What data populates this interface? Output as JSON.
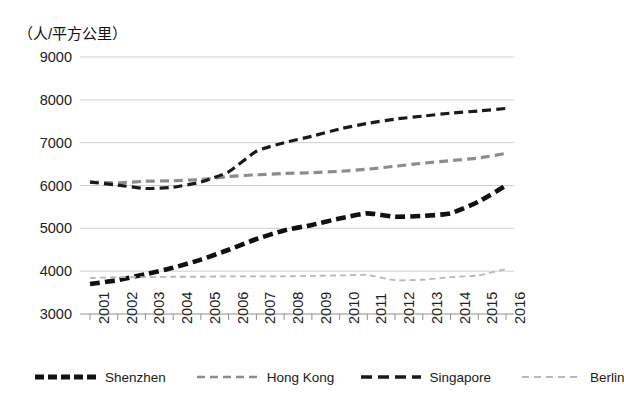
{
  "chart_data": {
    "type": "line",
    "title": "",
    "subtitle": "",
    "ylabel": "（人/平方公里）",
    "xlabel": "",
    "ylim": [
      3000,
      9000
    ],
    "ytick_values": [
      9000,
      8000,
      7000,
      6000,
      5000,
      4000,
      3000
    ],
    "ytick_labels": [
      "9000",
      "8000",
      "7000",
      "6000",
      "5000",
      "4000",
      "3000"
    ],
    "grid": true,
    "grid_axis": "y",
    "legend_position": "bottom",
    "categories": [
      "2001",
      "2002",
      "2003",
      "2004",
      "2005",
      "2006",
      "2007",
      "2008",
      "2009",
      "2010",
      "2011",
      "2012",
      "2013",
      "2014",
      "2015",
      "2016"
    ],
    "x": [
      2001,
      2002,
      2003,
      2004,
      2005,
      2006,
      2007,
      2008,
      2009,
      2010,
      2011,
      2012,
      2013,
      2014,
      2015,
      2016
    ],
    "series": [
      {
        "name": "Shenzhen",
        "color": "#111111",
        "style": "thick-dashed",
        "values": [
          3700,
          3790,
          3930,
          4080,
          4270,
          4500,
          4750,
          4950,
          5080,
          5230,
          5350,
          5270,
          5290,
          5350,
          5620,
          6000
        ]
      },
      {
        "name": "Hong Kong",
        "color": "#8c8c8c",
        "style": "dashed",
        "values": [
          6080,
          6060,
          6100,
          6110,
          6140,
          6210,
          6250,
          6280,
          6300,
          6330,
          6380,
          6450,
          6520,
          6580,
          6640,
          6750
        ]
      },
      {
        "name": "Singapore",
        "color": "#1a1a1a",
        "style": "dashed",
        "values": [
          6080,
          6010,
          5930,
          5960,
          6080,
          6320,
          6800,
          7000,
          7150,
          7320,
          7450,
          7550,
          7620,
          7690,
          7740,
          7800
        ]
      },
      {
        "name": "Berlin",
        "color": "#b8b8b8",
        "style": "fine-dashed",
        "values": [
          3840,
          3860,
          3860,
          3870,
          3870,
          3880,
          3880,
          3880,
          3890,
          3900,
          3910,
          3790,
          3800,
          3860,
          3900,
          4050
        ]
      }
    ]
  },
  "legend": {
    "items": [
      {
        "label": "Shenzhen"
      },
      {
        "label": "Hong Kong"
      },
      {
        "label": "Singapore"
      },
      {
        "label": "Berlin"
      }
    ]
  },
  "axis": {
    "unit_label": "（人/平方公里）"
  }
}
